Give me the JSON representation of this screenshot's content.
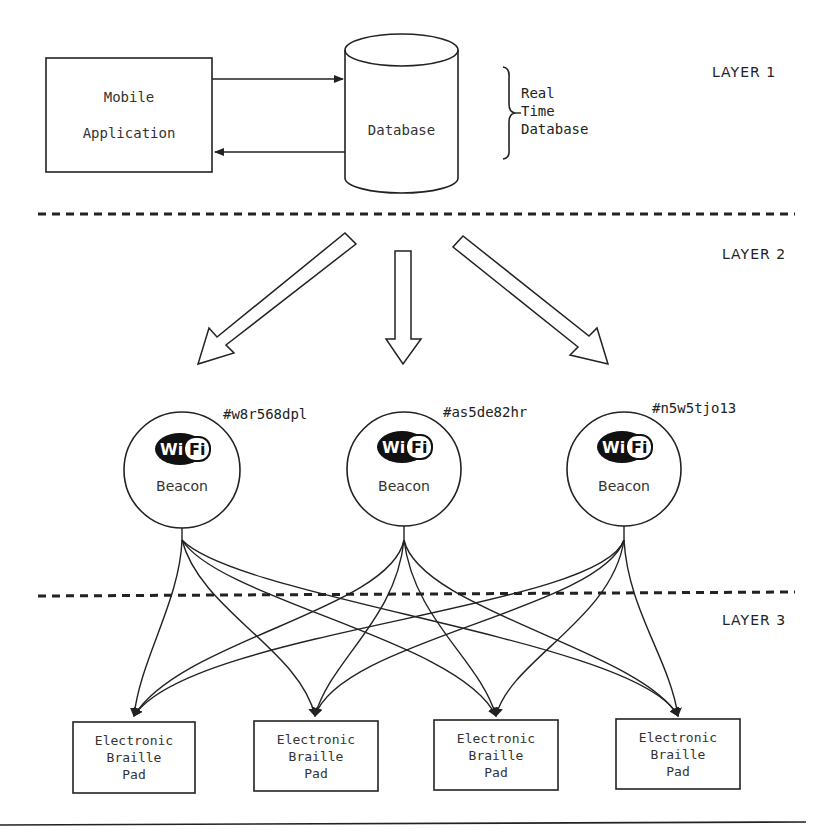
{
  "layer1": {
    "label": "LAYER 1",
    "mobile_app": {
      "line1": "Mobile",
      "line2": "Application"
    },
    "database": {
      "label": "Database"
    },
    "brace_label": {
      "line1": "Real",
      "line2": "Time",
      "line3": "Database"
    },
    "arrows": [
      {
        "from": "Mobile Application",
        "to": "Database"
      },
      {
        "from": "Database",
        "to": "Mobile Application"
      }
    ]
  },
  "layer2": {
    "label": "LAYER 2",
    "beacons": [
      {
        "id": "#w8r568dpl",
        "icon": "wifi-icon",
        "icon_text_left": "Wi",
        "icon_text_right": "Fi",
        "label": "Beacon"
      },
      {
        "id": "#as5de82hr",
        "icon": "wifi-icon",
        "icon_text_left": "Wi",
        "icon_text_right": "Fi",
        "label": "Beacon"
      },
      {
        "id": "#n5w5tjo13",
        "icon": "wifi-icon",
        "icon_text_left": "Wi",
        "icon_text_right": "Fi",
        "label": "Beacon"
      }
    ]
  },
  "layer3": {
    "label": "LAYER 3",
    "pads": [
      {
        "line1": "Electronic",
        "line2": "Braille",
        "line3": "Pad"
      },
      {
        "line1": "Electronic",
        "line2": "Braille",
        "line3": "Pad"
      },
      {
        "line1": "Electronic",
        "line2": "Braille",
        "line3": "Pad"
      },
      {
        "line1": "Electronic",
        "line2": "Braille",
        "line3": "Pad"
      }
    ],
    "connections": "each beacon connects to all four pads"
  },
  "colors": {
    "stroke": "#222222",
    "background": "#ffffff",
    "text": "#333333"
  }
}
